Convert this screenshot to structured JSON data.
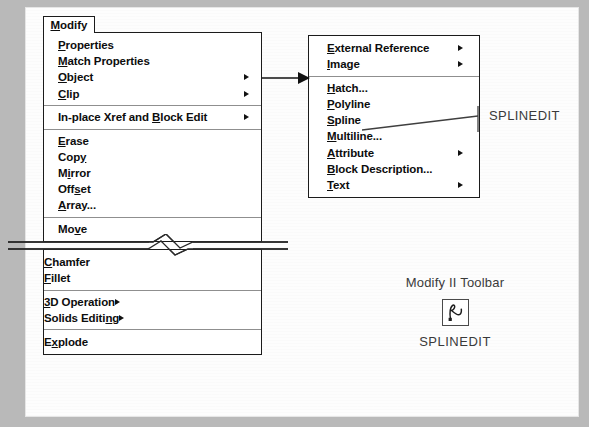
{
  "modify_menu": {
    "tab_label": "Modify",
    "tab_accel": "M",
    "groups": [
      {
        "items": [
          {
            "label": "Properties",
            "accel": "P",
            "submenu": false
          },
          {
            "label": "Match Properties",
            "accel": "M",
            "submenu": false
          },
          {
            "label": "Object",
            "accel": "O",
            "submenu": true
          },
          {
            "label": "Clip",
            "accel": "C",
            "submenu": true
          }
        ]
      },
      {
        "items": [
          {
            "label": "In-place Xref and Block Edit",
            "accel": "B",
            "submenu": true
          }
        ]
      },
      {
        "items": [
          {
            "label": "Erase",
            "accel": "E",
            "submenu": false
          },
          {
            "label": "Copy",
            "accel": "y",
            "submenu": false
          },
          {
            "label": "Mirror",
            "accel": "i",
            "submenu": false
          },
          {
            "label": "Offset",
            "accel": "s",
            "submenu": false
          },
          {
            "label": "Array...",
            "accel": "A",
            "submenu": false
          }
        ]
      },
      {
        "items": [
          {
            "label": "Move",
            "accel": "v",
            "submenu": false
          }
        ]
      }
    ],
    "groups_lower": [
      {
        "items": [
          {
            "label": "Chamfer",
            "accel": "C",
            "submenu": false
          },
          {
            "label": "Fillet",
            "accel": "F",
            "submenu": false
          }
        ]
      },
      {
        "items": [
          {
            "label": "3D Operation",
            "accel": "3",
            "submenu": true
          },
          {
            "label": "Solids Editing",
            "accel": "n",
            "submenu": true
          }
        ]
      },
      {
        "items": [
          {
            "label": "Explode",
            "accel": "x",
            "submenu": false
          }
        ]
      }
    ]
  },
  "object_submenu": {
    "groups": [
      {
        "items": [
          {
            "label": "External Reference",
            "accel": "E",
            "submenu": true
          },
          {
            "label": "Image",
            "accel": "I",
            "submenu": true
          }
        ]
      },
      {
        "items": [
          {
            "label": "Hatch...",
            "accel": "H",
            "submenu": false
          },
          {
            "label": "Polyline",
            "accel": "P",
            "submenu": false
          },
          {
            "label": "Spline",
            "accel": "S",
            "submenu": false
          },
          {
            "label": "Multiline...",
            "accel": "M",
            "submenu": false
          },
          {
            "label": "Attribute",
            "accel": "A",
            "submenu": true
          },
          {
            "label": "Block Description...",
            "accel": "B",
            "submenu": false
          },
          {
            "label": "Text",
            "accel": "T",
            "submenu": true
          }
        ]
      }
    ]
  },
  "callout": {
    "spline_command": "SPLINEDIT"
  },
  "toolbar": {
    "title": "Modify II Toolbar",
    "button_icon": "splinedit-spline-icon",
    "caption": "SPLINEDIT"
  },
  "colors": {
    "ink": "#0d0d0d",
    "menu_border": "#1b1b1b",
    "separator": "#8f8f8f",
    "page": "#fdfdfd",
    "margin": "#b9b9b9",
    "annotation": "#3a3a3a"
  }
}
